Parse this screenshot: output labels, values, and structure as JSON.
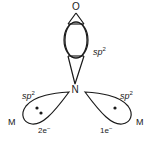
{
  "diagram": {
    "top_atom": "O",
    "center_atom": "N",
    "top_orbital": {
      "label_base": "sp",
      "label_sup": "2"
    },
    "left_orbital": {
      "label_base": "sp",
      "label_sup": "2",
      "electrons": "2e",
      "electrons_sup": "−",
      "metal": "M",
      "dots": 2
    },
    "right_orbital": {
      "label_base": "sp",
      "label_sup": "2",
      "electrons": "1e",
      "electrons_sup": "−",
      "metal": "M",
      "dots": 1
    }
  }
}
